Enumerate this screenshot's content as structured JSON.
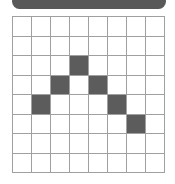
{
  "header": {
    "bar_color": "#595959"
  },
  "grid": {
    "rows": 8,
    "cols": 8,
    "filled_color": "#5c5c5c",
    "empty_color": "#ffffff",
    "line_color": "#a0a0a0",
    "filled_cells": [
      [
        2,
        3
      ],
      [
        3,
        2
      ],
      [
        3,
        4
      ],
      [
        4,
        1
      ],
      [
        4,
        5
      ],
      [
        5,
        6
      ]
    ]
  }
}
